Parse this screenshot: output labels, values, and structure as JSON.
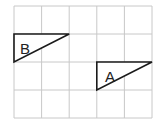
{
  "diagram": {
    "grid": {
      "columns": 5,
      "rows": 4,
      "origin_px": [
        14,
        6
      ],
      "cell_px": [
        27.6,
        28
      ],
      "line_color": "#c8c8c8"
    },
    "shapes": [
      {
        "label": "B",
        "type": "right-triangle",
        "vertices_cells": [
          [
            0,
            1
          ],
          [
            2,
            1
          ],
          [
            0,
            2
          ]
        ]
      },
      {
        "label": "A",
        "type": "right-triangle",
        "vertices_cells": [
          [
            3,
            2
          ],
          [
            5,
            2
          ],
          [
            3,
            3
          ]
        ]
      }
    ],
    "stroke_color": "#1a1a1a"
  }
}
